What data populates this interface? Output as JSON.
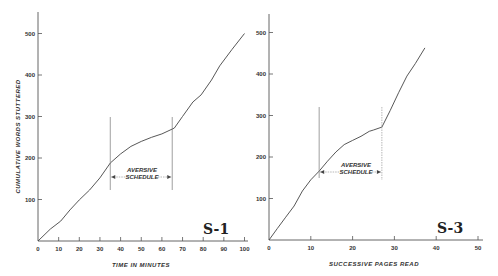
{
  "chart_data": [
    {
      "type": "line",
      "panel_label": "S-1",
      "title": "",
      "xlabel": "TIME IN MINUTES",
      "ylabel": "CUMULATIVE WORDS STUTTERED",
      "xlim": [
        0,
        100
      ],
      "ylim": [
        0,
        500
      ],
      "x_ticks": [
        0,
        10,
        20,
        30,
        40,
        50,
        60,
        70,
        80,
        90,
        100
      ],
      "y_ticks": [
        100,
        200,
        300,
        400,
        500
      ],
      "grid": false,
      "series": [
        {
          "name": "cumulative words stuttered",
          "x": [
            0,
            6,
            11,
            15.5,
            20,
            25,
            30,
            35,
            40,
            45,
            50,
            55,
            60,
            66,
            70,
            75,
            79,
            84,
            88,
            94,
            100
          ],
          "y": [
            0,
            29,
            48,
            75,
            99,
            123,
            152,
            188,
            210,
            228,
            240,
            250,
            258,
            272,
            300,
            335,
            352,
            388,
            422,
            462,
            500
          ]
        }
      ],
      "annotations": [
        {
          "text": "AVERSIVE SCHEDULE",
          "x_start": 35,
          "x_end": 65,
          "type": "interval-arrow"
        }
      ]
    },
    {
      "type": "line",
      "panel_label": "S-3",
      "title": "",
      "xlabel": "SUCCESSIVE PAGES READ",
      "ylabel": "",
      "xlim": [
        0,
        50
      ],
      "ylim": [
        0,
        500
      ],
      "x_ticks": [
        0,
        10,
        20,
        30,
        40,
        50
      ],
      "y_ticks": [
        100,
        200,
        300,
        400,
        500
      ],
      "grid": false,
      "series": [
        {
          "name": "cumulative words stuttered",
          "x": [
            0,
            2,
            4,
            6,
            8,
            10,
            12,
            14,
            16,
            18,
            20,
            22,
            24,
            25,
            27,
            29,
            31,
            33,
            35,
            37.3
          ],
          "y": [
            0,
            28,
            55,
            82,
            118,
            145,
            166,
            190,
            212,
            230,
            240,
            250,
            262,
            265,
            272,
            312,
            355,
            395,
            425,
            463
          ]
        }
      ],
      "annotations": [
        {
          "text": "AVERSIVE SCHEDULE",
          "x_start": 12,
          "x_end": 27,
          "type": "interval-arrow"
        }
      ]
    }
  ],
  "labels": {
    "left_ylabel": "CUMULATIVE WORDS STUTTERED",
    "left_xlabel": "TIME IN MINUTES",
    "right_xlabel": "SUCCESSIVE PAGES READ",
    "annot_line1": "AVERSIVE",
    "annot_line2": "SCHEDULE",
    "left_panel": "S-1",
    "right_panel": "S-3",
    "left_x_ticks": [
      "0",
      "10",
      "20",
      "30",
      "40",
      "50",
      "60",
      "70",
      "80",
      "90",
      "100"
    ],
    "right_x_ticks": [
      "0",
      "10",
      "20",
      "30",
      "40",
      "50"
    ],
    "y_ticks": [
      "100",
      "200",
      "300",
      "400",
      "500"
    ]
  }
}
